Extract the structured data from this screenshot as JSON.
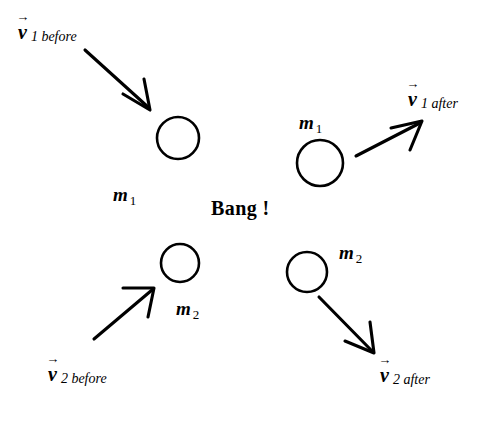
{
  "figure": {
    "type": "physics-collision-diagram",
    "background_color": "#ffffff",
    "stroke_color": "#000000",
    "width": 494,
    "height": 426
  },
  "center_text": {
    "bang": "Bang !"
  },
  "vectors": [
    {
      "id": "v1-before",
      "symbol": "v",
      "arrow_glyph": "→",
      "subscript": "1 before",
      "label_x": 18,
      "label_y": 22,
      "line": {
        "x1": 85,
        "y1": 50,
        "x2": 150,
        "y2": 109
      },
      "direction": "down-right"
    },
    {
      "id": "v1-after",
      "symbol": "v",
      "arrow_glyph": "→",
      "subscript": "1 after",
      "label_x": 408,
      "label_y": 89,
      "line": {
        "x1": 356,
        "y1": 156,
        "x2": 422,
        "y2": 121
      },
      "direction": "up-right"
    },
    {
      "id": "v2-before",
      "symbol": "v",
      "arrow_glyph": "→",
      "subscript": "2 before",
      "label_x": 48,
      "label_y": 364,
      "line": {
        "x1": 94,
        "y1": 339,
        "x2": 154,
        "y2": 288
      },
      "direction": "up-right"
    },
    {
      "id": "v2-after",
      "symbol": "v",
      "arrow_glyph": "→",
      "subscript": "2 after",
      "label_x": 380,
      "label_y": 365,
      "line": {
        "x1": 319,
        "y1": 297,
        "x2": 375,
        "y2": 354
      },
      "direction": "down-right"
    }
  ],
  "masses": [
    {
      "id": "m1-before",
      "symbol": "m",
      "subscript": "1",
      "label_x": 113,
      "label_y": 185,
      "circle": {
        "cx": 178,
        "cy": 138,
        "r": 21
      }
    },
    {
      "id": "m1-after",
      "symbol": "m",
      "subscript": "1",
      "label_x": 299,
      "label_y": 113,
      "circle": {
        "cx": 320,
        "cy": 163,
        "r": 23
      }
    },
    {
      "id": "m2-before",
      "symbol": "m",
      "subscript": "2",
      "label_x": 176,
      "label_y": 299,
      "circle": {
        "cx": 180,
        "cy": 263,
        "r": 19
      }
    },
    {
      "id": "m2-after",
      "symbol": "m",
      "subscript": "2",
      "label_x": 339,
      "label_y": 243,
      "circle": {
        "cx": 307,
        "cy": 272,
        "r": 20
      }
    }
  ]
}
